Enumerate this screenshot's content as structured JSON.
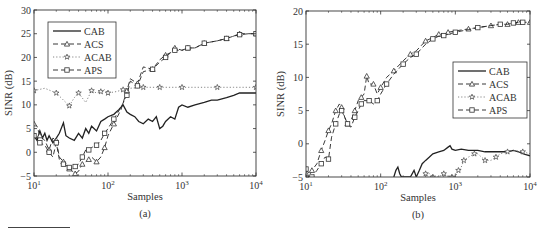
{
  "chart_data": [
    {
      "id": "a",
      "type": "line",
      "caption": "(a)",
      "xlabel": "Samples",
      "ylabel": "SINR (dB)",
      "xscale": "log",
      "xlim": [
        10,
        10000
      ],
      "ylim": [
        -5,
        30
      ],
      "xticks": [
        10,
        100,
        1000,
        10000
      ],
      "xtick_labels": [
        "10^1",
        "10^2",
        "10^3",
        "10^4"
      ],
      "yticks": [
        -5,
        0,
        5,
        10,
        15,
        20,
        25,
        30
      ],
      "grid": false,
      "legend": {
        "position": "upper left",
        "entries": [
          "CAB",
          "ACS",
          "ACAB",
          "APS"
        ]
      },
      "series": [
        {
          "name": "CAB",
          "style": "solid",
          "marker": "none",
          "x": [
            10,
            11,
            12,
            13,
            14,
            15,
            16,
            18,
            20,
            22,
            25,
            27,
            30,
            35,
            40,
            45,
            50,
            55,
            60,
            70,
            80,
            90,
            100,
            120,
            140,
            160,
            180,
            200,
            230,
            260,
            300,
            350,
            400,
            450,
            500,
            550,
            600,
            700,
            800,
            900,
            1000,
            1200,
            1500,
            2000,
            2500,
            3000,
            4000,
            5000,
            6000,
            7000,
            8000,
            10000
          ],
          "y": [
            3.5,
            2.5,
            4.5,
            3.0,
            4.0,
            2.5,
            3.5,
            2.0,
            3.0,
            4.0,
            6.2,
            3.5,
            3.0,
            2.5,
            4.0,
            3.0,
            5.0,
            4.0,
            5.5,
            4.5,
            6.5,
            7.0,
            7.5,
            8.0,
            9.0,
            10.0,
            8.5,
            8.0,
            7.5,
            6.5,
            6.0,
            7.0,
            6.5,
            7.5,
            5.0,
            5.5,
            6.5,
            7.5,
            7.0,
            9.5,
            10.0,
            9.5,
            10.0,
            10.5,
            11.0,
            11.0,
            11.5,
            12.0,
            12.5,
            12.5,
            12.5,
            12.5
          ]
        },
        {
          "name": "ACS",
          "style": "dashed",
          "marker": "triangle",
          "x": [
            10,
            11,
            12,
            14,
            16,
            18,
            20,
            22,
            25,
            28,
            30,
            33,
            36,
            40,
            45,
            50,
            55,
            60,
            70,
            80,
            90,
            100,
            120,
            150,
            180,
            200,
            250,
            300,
            400,
            500,
            600,
            700,
            800,
            1000,
            1200,
            1500,
            2000,
            3000,
            4000,
            5000,
            6000,
            8000,
            10000
          ],
          "y": [
            6.0,
            5.5,
            3.5,
            2.5,
            0.5,
            3.0,
            2.5,
            -1.0,
            -2.0,
            -3.0,
            -3.5,
            -4.0,
            -4.5,
            -4.0,
            -2.5,
            -2.0,
            -1.5,
            -1.0,
            -2.0,
            -1.0,
            1.0,
            3.5,
            6.0,
            9.0,
            13.0,
            15.5,
            14.5,
            18.0,
            17.5,
            19.5,
            20.5,
            21.0,
            22.0,
            21.5,
            22.0,
            22.0,
            23.0,
            23.5,
            24.0,
            24.5,
            25.0,
            25.0,
            25.0
          ]
        },
        {
          "name": "ACAB",
          "style": "dotted",
          "marker": "star",
          "x": [
            10,
            14,
            20,
            25,
            30,
            35,
            40,
            50,
            60,
            70,
            80,
            90,
            100,
            130,
            160,
            200,
            300,
            400,
            500,
            700,
            1000,
            2000,
            3000,
            5000,
            10000
          ],
          "y": [
            13.0,
            13.5,
            12.5,
            11.0,
            9.8,
            11.5,
            12.5,
            10.5,
            13.0,
            12.5,
            12.8,
            13.2,
            12.5,
            12.8,
            13.2,
            13.5,
            13.7,
            13.7,
            13.7,
            13.7,
            13.7,
            13.7,
            13.7,
            13.7,
            13.7
          ]
        },
        {
          "name": "APS",
          "style": "dashed",
          "marker": "square",
          "x": [
            10,
            11,
            12,
            14,
            16,
            18,
            20,
            22,
            25,
            28,
            30,
            33,
            36,
            40,
            45,
            50,
            55,
            60,
            70,
            80,
            90,
            100,
            120,
            150,
            180,
            200,
            250,
            300,
            400,
            500,
            600,
            700,
            800,
            1000,
            1200,
            1500,
            2000,
            3000,
            4000,
            5000,
            6000,
            8000,
            10000
          ],
          "y": [
            3.5,
            3.0,
            2.0,
            1.5,
            0.0,
            -1.0,
            2.0,
            -1.5,
            -2.5,
            -3.0,
            -3.2,
            -3.5,
            -3.0,
            -2.5,
            -1.0,
            0.5,
            0.5,
            1.0,
            1.5,
            2.5,
            4.0,
            5.0,
            7.0,
            9.5,
            12.0,
            15.0,
            14.0,
            17.0,
            17.5,
            19.0,
            20.0,
            21.0,
            21.5,
            21.5,
            22.0,
            22.0,
            23.0,
            23.5,
            24.0,
            24.5,
            24.8,
            25.0,
            25.0
          ]
        }
      ]
    },
    {
      "id": "b",
      "type": "line",
      "caption": "(b)",
      "xlabel": "Samples",
      "ylabel": "SINR (dB)",
      "xscale": "log",
      "xlim": [
        10,
        10000
      ],
      "ylim": [
        -5,
        20
      ],
      "xticks": [
        10,
        100,
        1000,
        10000
      ],
      "xtick_labels": [
        "10^1",
        "10^2",
        "10^3",
        "10^4"
      ],
      "yticks": [
        -5,
        0,
        5,
        10,
        15,
        20
      ],
      "grid": false,
      "legend": {
        "position": "center right",
        "entries": [
          "CAB",
          "ACS",
          "ACAB",
          "APS"
        ]
      },
      "series": [
        {
          "name": "CAB",
          "style": "solid",
          "marker": "none",
          "x": [
            150,
            160,
            170,
            180,
            190,
            200,
            250,
            280,
            300,
            330,
            360,
            400,
            450,
            500,
            600,
            700,
            800,
            850,
            900,
            1000,
            1200,
            1500,
            2000,
            2500,
            3000,
            4000,
            5000,
            6000,
            7000,
            8000,
            10000
          ],
          "y": [
            -5,
            -4.0,
            -3.5,
            -4.5,
            -5,
            -5,
            -5,
            -4.0,
            -5,
            -4.0,
            -3.0,
            -2.5,
            -2.0,
            -1.5,
            -1.2,
            -1.0,
            -0.5,
            -0.3,
            -0.8,
            -1.0,
            -0.8,
            -1.0,
            -1.0,
            -1.2,
            -1.2,
            -1.2,
            -1.2,
            -1.0,
            -1.2,
            -1.5,
            -1.8
          ]
        },
        {
          "name": "ACS",
          "style": "dashed",
          "marker": "triangle",
          "x": [
            10,
            11,
            12,
            14,
            16,
            18,
            20,
            22,
            25,
            28,
            30,
            33,
            36,
            40,
            45,
            50,
            55,
            60,
            65,
            70,
            80,
            90,
            100,
            120,
            150,
            200,
            250,
            300,
            400,
            500,
            600,
            700,
            800,
            1000,
            1500,
            2000,
            3000,
            4000,
            5000,
            6000,
            7000,
            8000,
            10000
          ],
          "y": [
            -4.5,
            -5,
            -4.0,
            -3.0,
            -1.0,
            0.5,
            2.0,
            3.0,
            5.0,
            6.0,
            5.5,
            4.0,
            3.0,
            3.5,
            5.0,
            6.5,
            7.0,
            7.5,
            10.2,
            9.0,
            9.0,
            7.5,
            8.5,
            10.0,
            11.0,
            12.5,
            13.5,
            14.0,
            15.5,
            16.0,
            16.5,
            16.5,
            16.8,
            17.0,
            17.3,
            17.5,
            17.8,
            18.0,
            18.0,
            18.2,
            18.3,
            18.3,
            18.3
          ]
        },
        {
          "name": "ACAB",
          "style": "dotted",
          "marker": "star",
          "x": [
            400,
            450,
            500,
            600,
            700,
            800,
            900,
            1000,
            1100,
            1200,
            1300,
            1500,
            1800,
            2000,
            2500,
            3000,
            3500,
            4000,
            5000,
            6000,
            8000,
            10000
          ],
          "y": [
            -4.5,
            -4.5,
            -5,
            -5,
            -4.5,
            -5,
            -5,
            -5,
            -4.0,
            -3.5,
            -2.5,
            -2.0,
            -1.5,
            -1.5,
            -2.5,
            -2.5,
            -2.0,
            -1.5,
            -1.2,
            -1.0,
            -1.2,
            -1.5
          ]
        },
        {
          "name": "APS",
          "style": "dashed",
          "marker": "square",
          "x": [
            10,
            11,
            12,
            14,
            16,
            18,
            20,
            22,
            25,
            28,
            30,
            33,
            36,
            40,
            45,
            50,
            55,
            60,
            70,
            80,
            90,
            100,
            120,
            150,
            200,
            250,
            300,
            400,
            500,
            600,
            700,
            800,
            1000,
            1500,
            2000,
            3000,
            4000,
            5000,
            6000,
            7000,
            8000,
            10000
          ],
          "y": [
            -3.8,
            -4.5,
            -5,
            -4.0,
            -3.0,
            -2.0,
            -2.3,
            1.0,
            3.0,
            4.5,
            5.0,
            4.0,
            3.0,
            2.5,
            4.0,
            5.0,
            6.0,
            6.5,
            6.5,
            6.0,
            6.5,
            7.5,
            9.0,
            10.5,
            12.0,
            13.0,
            13.5,
            15.0,
            15.8,
            16.2,
            16.3,
            16.5,
            16.8,
            17.2,
            17.5,
            17.8,
            18.0,
            18.0,
            18.2,
            18.3,
            18.3,
            18.3
          ]
        }
      ]
    }
  ]
}
